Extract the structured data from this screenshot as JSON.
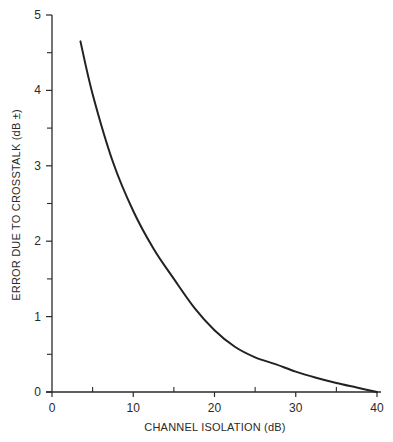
{
  "chart_data": {
    "type": "line",
    "title": "",
    "xlabel": "CHANNEL ISOLATION (dB)",
    "ylabel": "ERROR DUE TO CROSSTALK (dB ±)",
    "xlim": [
      0,
      40
    ],
    "ylim": [
      0,
      5
    ],
    "xticks": [
      0,
      10,
      20,
      30,
      40
    ],
    "xticks_minor": [
      5,
      15,
      25,
      35
    ],
    "yticks": [
      0,
      1,
      2,
      3,
      4,
      5
    ],
    "yticks_minor": [
      0.5,
      1.5,
      2.5,
      3.5,
      4.5
    ],
    "grid": false,
    "legend": null,
    "series": [
      {
        "name": "Crosstalk error",
        "color": "#222222",
        "x": [
          3.5,
          5,
          7.5,
          10,
          12.5,
          15,
          17.5,
          20,
          22.5,
          25,
          27.5,
          30,
          32.5,
          35,
          37.5,
          40
        ],
        "y": [
          4.65,
          3.95,
          3.05,
          2.4,
          1.9,
          1.5,
          1.12,
          0.82,
          0.6,
          0.46,
          0.37,
          0.27,
          0.19,
          0.12,
          0.06,
          0.0
        ]
      }
    ]
  },
  "axes": {
    "x_tick_labels": [
      "0",
      "10",
      "20",
      "30",
      "40"
    ],
    "y_tick_labels": [
      "0",
      "1",
      "2",
      "3",
      "4",
      "5"
    ],
    "x_title": "CHANNEL ISOLATION (dB)",
    "y_title": "ERROR DUE TO CROSSTALK (dB ±)"
  }
}
